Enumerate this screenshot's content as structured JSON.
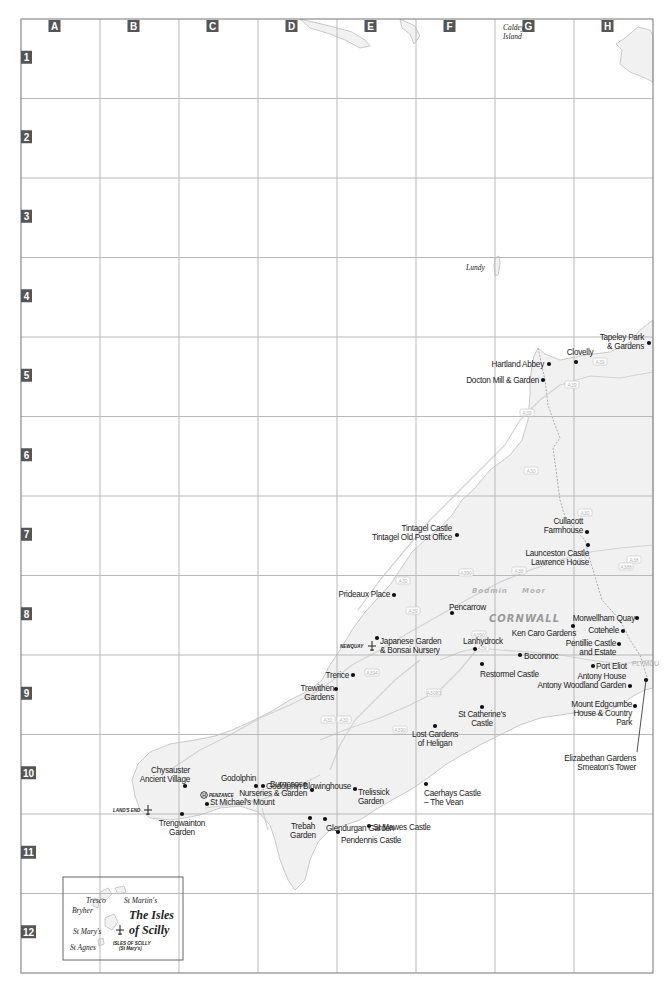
{
  "map": {
    "region": "CORNWALL",
    "moor_words": [
      "Bodmin",
      "Moor"
    ],
    "columns": [
      "A",
      "B",
      "C",
      "D",
      "E",
      "F",
      "G",
      "H"
    ],
    "rows": [
      "1",
      "2",
      "3",
      "4",
      "5",
      "6",
      "7",
      "8",
      "9",
      "10",
      "11",
      "12"
    ],
    "islands": [
      {
        "id": "caldey",
        "lines": [
          "Caldey",
          "Island"
        ]
      },
      {
        "id": "lundy",
        "lines": [
          "Lundy"
        ]
      }
    ],
    "places": [
      {
        "id": "tapeley",
        "lines": [
          "Tapeley Park",
          "& Gardens"
        ]
      },
      {
        "id": "clovelly",
        "lines": [
          "Clovelly"
        ]
      },
      {
        "id": "hartland",
        "lines": [
          "Hartland Abbey"
        ]
      },
      {
        "id": "docton",
        "lines": [
          "Docton Mill & Garden"
        ]
      },
      {
        "id": "tintagel",
        "lines": [
          "Tintagel Castle",
          "Tintagel Old Post Office"
        ]
      },
      {
        "id": "cullacott",
        "lines": [
          "Cullacott",
          "Farmhouse"
        ]
      },
      {
        "id": "launceston",
        "lines": [
          "Launceston Castle",
          "Lawrence House"
        ]
      },
      {
        "id": "prideaux",
        "lines": [
          "Prideaux Place"
        ]
      },
      {
        "id": "pencarrow",
        "lines": [
          "Pencarrow"
        ]
      },
      {
        "id": "morwellham",
        "lines": [
          "Morwellham Quay"
        ]
      },
      {
        "id": "kencaro",
        "lines": [
          "Ken Caro Gardens"
        ]
      },
      {
        "id": "cotehele",
        "lines": [
          "Cotehele"
        ]
      },
      {
        "id": "japanese",
        "lines": [
          "Japanese Garden",
          "& Bonsai Nursery"
        ]
      },
      {
        "id": "lanhydrock",
        "lines": [
          "Lanhydrock"
        ]
      },
      {
        "id": "pentillie",
        "lines": [
          "Pentillie Castle",
          "and Estate"
        ]
      },
      {
        "id": "boconnoc",
        "lines": [
          "Boconnoc"
        ]
      },
      {
        "id": "restormel",
        "lines": [
          "Restormel Castle"
        ]
      },
      {
        "id": "porteliot",
        "lines": [
          "Port Eliot"
        ]
      },
      {
        "id": "antony",
        "lines": [
          "Antony House",
          "Antony Woodland Garden"
        ]
      },
      {
        "id": "trerice",
        "lines": [
          "Trerice"
        ]
      },
      {
        "id": "trewithen",
        "lines": [
          "Trewithen",
          "Gardens"
        ]
      },
      {
        "id": "stcatherine",
        "lines": [
          "St Catherine's",
          "Castle"
        ]
      },
      {
        "id": "edgcumbe",
        "lines": [
          "Mount Edgcumbe",
          "House & Country",
          "Park"
        ]
      },
      {
        "id": "heligan",
        "lines": [
          "Lost Gardens",
          "of Heligan"
        ]
      },
      {
        "id": "elizabethan",
        "lines": [
          "Elizabethan Gardens",
          "Smeaton's Tower"
        ]
      },
      {
        "id": "burncoose",
        "lines": [
          "Burncoose",
          "Nurseries & Garden"
        ]
      },
      {
        "id": "trelissick",
        "lines": [
          "Trelissick",
          "Garden"
        ]
      },
      {
        "id": "caerhays",
        "lines": [
          "Caerhays Castle",
          "– The Vean"
        ]
      },
      {
        "id": "chysauster",
        "lines": [
          "Chysauster",
          "Ancient Village"
        ]
      },
      {
        "id": "godolphin",
        "lines": [
          "Godolphin"
        ]
      },
      {
        "id": "blowinghouse",
        "lines": [
          "Godolphin Blowinghouse"
        ]
      },
      {
        "id": "stmichael",
        "lines": [
          "St Michael's Mount"
        ]
      },
      {
        "id": "stmawes",
        "lines": [
          "St Mawes Castle"
        ]
      },
      {
        "id": "pendennis",
        "lines": [
          "Pendennis Castle"
        ]
      },
      {
        "id": "trengwainton",
        "lines": [
          "Trengwainton",
          "Garden"
        ]
      },
      {
        "id": "trebah",
        "lines": [
          "Trebah",
          "Garden"
        ]
      },
      {
        "id": "glendurgan",
        "lines": [
          "Glendurgan Garden"
        ]
      }
    ],
    "airports": [
      {
        "id": "newquay",
        "label": "NEWQUAY"
      },
      {
        "id": "landsend",
        "label": "LAND'S END"
      },
      {
        "id": "scilly",
        "label": "ISLES OF SCILLY",
        "sublabel": "(St Mary's)"
      }
    ],
    "heliport": {
      "label": "PENZANCE",
      "symbol": "H"
    },
    "plymouth_fragment": "PLYMOU",
    "roads": [
      "A39",
      "A39",
      "A39",
      "A30",
      "A30",
      "A30",
      "A38",
      "A388",
      "A390",
      "A38",
      "A30",
      "A3075",
      "A39",
      "A390",
      "A39",
      "A394",
      "A3083",
      "A30",
      "A30",
      "A390"
    ],
    "inset": {
      "title_lines": [
        "The Isles",
        "of Scilly"
      ],
      "islands": [
        "Tresco",
        "St Martin's",
        "Bryher",
        "St Mary's",
        "St Agnes"
      ]
    }
  }
}
